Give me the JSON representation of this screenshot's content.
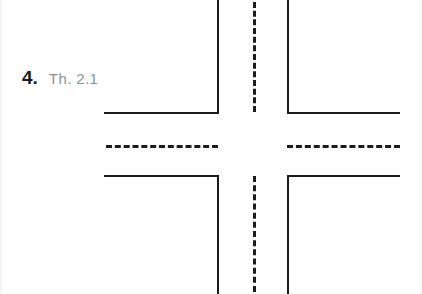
{
  "page": {
    "width": 422,
    "height": 294,
    "background_color": "#fefefe",
    "ink_color": "#1c1c1c"
  },
  "label": {
    "item_number": "4.",
    "item_number_color": "#1b1b1b",
    "answer_text": "Th. 2.1",
    "answer_text_color": "#8e9194"
  },
  "diagram": {
    "name": "four-way-intersection",
    "curbs": [
      {
        "name": "curb-top-left-vertical",
        "orientation": "vertical",
        "x": 217,
        "y": 0,
        "length": 114
      },
      {
        "name": "curb-top-left-horizontal",
        "orientation": "horizontal",
        "x": 104,
        "y": 112,
        "length": 115
      },
      {
        "name": "curb-top-right-vertical",
        "orientation": "vertical",
        "x": 287,
        "y": 0,
        "length": 114
      },
      {
        "name": "curb-top-right-horizontal",
        "orientation": "horizontal",
        "x": 287,
        "y": 112,
        "length": 113
      },
      {
        "name": "curb-bottom-left-horizontal",
        "orientation": "horizontal",
        "x": 104,
        "y": 175,
        "length": 115
      },
      {
        "name": "curb-bottom-left-vertical",
        "orientation": "vertical",
        "x": 217,
        "y": 175,
        "length": 119
      },
      {
        "name": "curb-bottom-right-horizontal",
        "orientation": "horizontal",
        "x": 287,
        "y": 175,
        "length": 113
      },
      {
        "name": "curb-bottom-right-vertical",
        "orientation": "vertical",
        "x": 287,
        "y": 175,
        "length": 119
      }
    ],
    "center_lines": [
      {
        "name": "center-line-west",
        "orientation": "horizontal",
        "x": 106,
        "y": 145,
        "length": 112
      },
      {
        "name": "center-line-east",
        "orientation": "horizontal",
        "x": 287,
        "y": 145,
        "length": 113
      },
      {
        "name": "center-line-north",
        "orientation": "vertical",
        "x": 253,
        "y": 2,
        "length": 110
      },
      {
        "name": "center-line-south",
        "orientation": "vertical",
        "x": 253,
        "y": 176,
        "length": 116
      }
    ]
  }
}
